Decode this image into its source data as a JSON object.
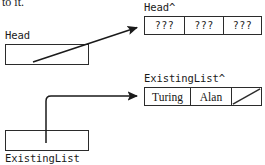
{
  "page": {
    "width": 265,
    "height": 165,
    "background": "#ffffff",
    "ink": "#1a1a1a"
  },
  "clipped_text": "to it.",
  "variables": [
    {
      "id": "head",
      "label": "Head",
      "label_position": "above-box",
      "box": {
        "x": 5,
        "y": 44,
        "w": 84,
        "h": 21
      }
    },
    {
      "id": "existing",
      "label": "ExistingList",
      "label_position": "below-box",
      "box": {
        "x": 5,
        "y": 130,
        "w": 84,
        "h": 21
      }
    }
  ],
  "nodes": [
    {
      "id": "head-node",
      "label": "Head^",
      "box": {
        "x": 144,
        "y": 16,
        "w": 118,
        "h": 19
      },
      "cells": [
        {
          "kind": "unknown",
          "text": "???"
        },
        {
          "kind": "unknown",
          "text": "???"
        },
        {
          "kind": "unknown",
          "text": "???"
        }
      ]
    },
    {
      "id": "existing-node",
      "label": "ExistingList^",
      "box": {
        "x": 144,
        "y": 87,
        "w": 118,
        "h": 19
      },
      "cells": [
        {
          "kind": "text",
          "text": "Turing"
        },
        {
          "kind": "text",
          "text": "Alan"
        },
        {
          "kind": "nil",
          "text": ""
        }
      ]
    }
  ],
  "connectors": [
    {
      "id": "head-pointer",
      "style": "straight-diagonal",
      "from": "head-box-interior",
      "to": "head-node",
      "arrowhead": "solid-triangle"
    },
    {
      "id": "existinglist-pointer",
      "style": "elbow-up-right",
      "from": "existinglist-box-interior",
      "to": "existing-node",
      "arrowhead": "solid-triangle"
    }
  ]
}
